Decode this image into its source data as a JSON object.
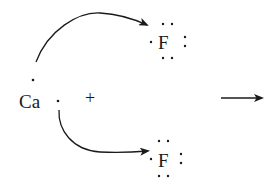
{
  "diagram": {
    "type": "lewis-dot-reaction",
    "reactants": {
      "metal": {
        "symbol": "Ca",
        "valence_electrons": 2,
        "plus_sign": "+"
      },
      "halogens": [
        {
          "symbol": "F",
          "position": "top",
          "valence_electrons": 7
        },
        {
          "symbol": "F",
          "position": "bottom",
          "valence_electrons": 7
        }
      ]
    },
    "electron_transfer_arrows": [
      {
        "from": "Ca",
        "to": "F (top)"
      },
      {
        "from": "Ca",
        "to": "F (bottom)"
      }
    ],
    "reaction_arrow": "→",
    "colors": {
      "ink": "#1a1a1a",
      "background": "#ffffff"
    }
  }
}
